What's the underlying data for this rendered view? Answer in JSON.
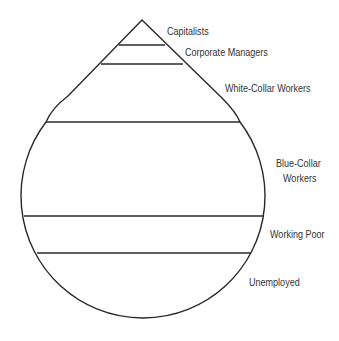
{
  "diagram": {
    "type": "class-structure teardrop",
    "layers": [
      {
        "label": "Capitalists"
      },
      {
        "label": "Corporate Managers"
      },
      {
        "label": "White-Collar Workers"
      },
      {
        "label": "Blue-Collar Workers",
        "line1": "Blue-Collar",
        "line2": "Workers"
      },
      {
        "label": "Working Poor"
      },
      {
        "label": "Unemployed"
      }
    ],
    "stroke_color": "#2a2a2a",
    "text_color": "#333333"
  }
}
